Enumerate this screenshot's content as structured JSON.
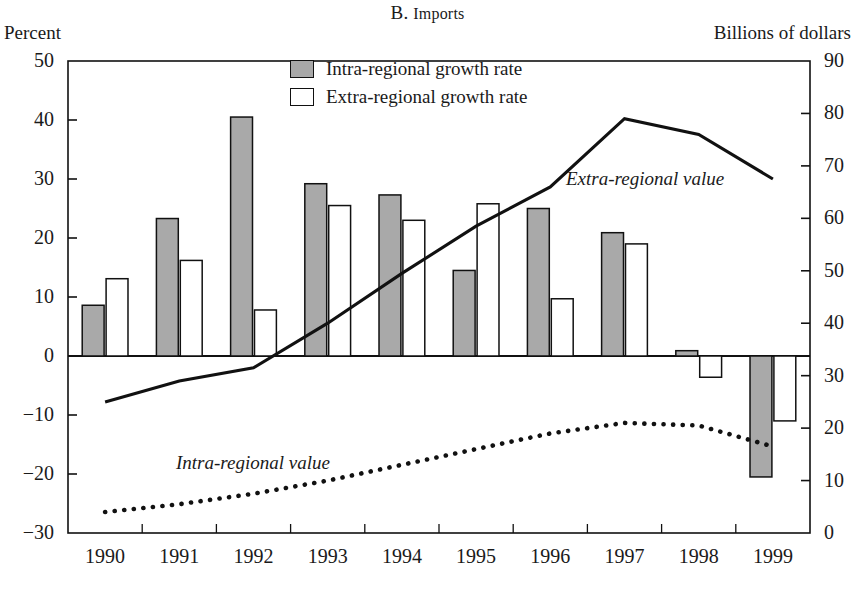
{
  "header": {
    "title_prefix": "B. ",
    "title_main": "Imports",
    "left_axis_unit": "Percent",
    "right_axis_unit": "Billions of dollars"
  },
  "legend": {
    "items": [
      {
        "label": "Intra-regional growth rate",
        "swatch": "gray-filled-square",
        "color": "#a8a8a8"
      },
      {
        "label": "Extra-regional growth rate",
        "swatch": "white-filled-square",
        "color": "#ffffff"
      }
    ]
  },
  "annotations": [
    {
      "name": "extra-regional-value-label",
      "text": "Extra-regional value"
    },
    {
      "name": "intra-regional-value-label",
      "text": "Intra-regional value"
    }
  ],
  "chart_data": {
    "type": "bar",
    "title": "B. Imports",
    "xlabel": "",
    "ylabel": "Percent",
    "y2label": "Billions of dollars",
    "categories": [
      "1990",
      "1991",
      "1992",
      "1993",
      "1994",
      "1995",
      "1996",
      "1997",
      "1998",
      "1999"
    ],
    "ylim": [
      -30,
      50
    ],
    "yticks": [
      50,
      40,
      30,
      20,
      10,
      0,
      -10,
      -20,
      -30
    ],
    "ytick_labels": [
      "50",
      "40",
      "30",
      "20",
      "10",
      "0",
      "−10",
      "−20",
      "−30"
    ],
    "y2lim": [
      0,
      90
    ],
    "y2ticks": [
      90,
      80,
      70,
      60,
      50,
      40,
      30,
      20,
      10,
      0
    ],
    "y2tick_labels": [
      "90",
      "80",
      "70",
      "60",
      "50",
      "40",
      "30",
      "20",
      "10",
      "0"
    ],
    "grid": false,
    "legend_position": "top-center",
    "series": [
      {
        "name": "Intra-regional growth rate",
        "kind": "bar",
        "axis": "left",
        "unit": "percent",
        "values": [
          8.6,
          23.3,
          40.5,
          29.2,
          27.3,
          14.5,
          25.0,
          20.9,
          0.9,
          -20.5
        ]
      },
      {
        "name": "Extra-regional growth rate",
        "kind": "bar",
        "axis": "left",
        "unit": "percent",
        "values": [
          13.1,
          16.2,
          7.8,
          25.5,
          23.0,
          25.8,
          9.7,
          19.0,
          -3.6,
          -11.0
        ]
      },
      {
        "name": "Extra-regional value",
        "kind": "line",
        "style": "solid",
        "axis": "right",
        "unit": "billions of dollars",
        "values": [
          25.0,
          29.0,
          31.5,
          40.0,
          49.5,
          58.5,
          66.0,
          79.0,
          76.0,
          67.5
        ]
      },
      {
        "name": "Intra-regional value",
        "kind": "line",
        "style": "dotted",
        "axis": "right",
        "unit": "billions of dollars",
        "values": [
          4.0,
          5.5,
          7.5,
          10.0,
          13.0,
          16.0,
          19.0,
          21.0,
          20.5,
          16.5
        ]
      }
    ]
  }
}
